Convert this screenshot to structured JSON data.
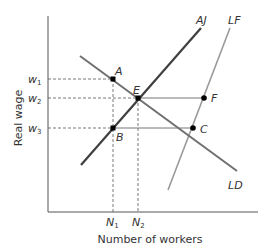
{
  "axes": {
    "y_label": "Real wage",
    "x_label": "Number of workers"
  },
  "curves": {
    "AJ": {
      "label": "AJ",
      "color": "#444444",
      "x1": 81,
      "y1": 165,
      "x2": 201,
      "y2": 28
    },
    "LF": {
      "label": "LF",
      "color": "#999999",
      "x1": 168,
      "y1": 190,
      "x2": 230,
      "y2": 28
    },
    "LD": {
      "label": "LD",
      "color": "#777777",
      "x1": 80,
      "y1": 56,
      "x2": 237,
      "y2": 171
    }
  },
  "points": {
    "A": {
      "label": "A",
      "x": 113,
      "y": 79
    },
    "E": {
      "label": "E",
      "x": 138,
      "y": 98
    },
    "B": {
      "label": "B",
      "x": 113,
      "y": 128
    },
    "F": {
      "label": "F",
      "x": 204,
      "y": 98
    },
    "C": {
      "label": "C",
      "x": 193,
      "y": 128
    }
  },
  "wage_ticks": {
    "w1": {
      "base": "w",
      "sub": "1",
      "y": 79
    },
    "w2": {
      "base": "w",
      "sub": "2",
      "y": 98
    },
    "w3": {
      "base": "w",
      "sub": "3",
      "y": 128
    }
  },
  "quantity_ticks": {
    "N1": {
      "base": "N",
      "sub": "1",
      "x": 113
    },
    "N2": {
      "base": "N",
      "sub": "2",
      "x": 138
    }
  },
  "colors": {
    "axis": "#555555",
    "dashed": "#555555",
    "point": "#000000"
  }
}
